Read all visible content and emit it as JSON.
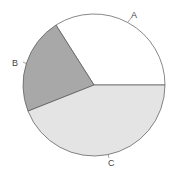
{
  "chart_data": {
    "type": "pie",
    "title": "",
    "categories": [
      "A",
      "B",
      "C"
    ],
    "values": [
      34,
      22,
      44
    ],
    "start_angle_deg": 0,
    "direction": "counterclockwise",
    "colors": [
      "#ffffff",
      "#a8a8a8",
      "#e4e4e4"
    ],
    "stroke_color": "#555555",
    "legend": "none",
    "labels_outside": true
  },
  "labels": {
    "a": "A",
    "b": "B",
    "c": "C"
  }
}
